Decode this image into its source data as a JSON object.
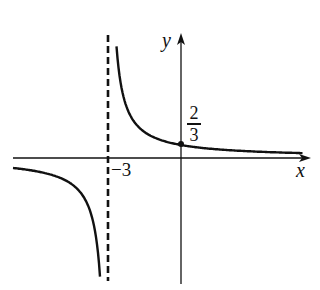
{
  "chart_data": {
    "type": "line",
    "title": "",
    "function": "y = 2/(x+3)",
    "xlabel": "x",
    "ylabel": "y",
    "annotations": {
      "vertical_asymptote": {
        "x": -3,
        "label": "−3",
        "style": "dashed"
      },
      "horizontal_asymptote": {
        "y": 0
      },
      "point": {
        "x": 0,
        "y": 0.6667,
        "label_num": "2",
        "label_den": "3"
      }
    },
    "series": [
      {
        "name": "left-branch",
        "x": [
          -10.5,
          -8,
          -6,
          -5,
          -4,
          -3.5,
          -3.2
        ],
        "y": [
          -0.267,
          -0.4,
          -0.667,
          -1,
          -2,
          -4,
          -10
        ]
      },
      {
        "name": "right-branch",
        "x": [
          -2.72,
          -2.5,
          -2,
          -1,
          0,
          1,
          2,
          3,
          4.9
        ],
        "y": [
          7.1,
          4,
          2,
          1,
          0.667,
          0.5,
          0.4,
          0.333,
          0.253
        ]
      }
    ],
    "grid": false,
    "legend": null,
    "colors": {
      "stroke": "#111111",
      "background": "#ffffff"
    }
  },
  "labels": {
    "x_axis": "x",
    "y_axis": "y",
    "asymptote_tick": "−3",
    "point_num": "2",
    "point_den": "3"
  }
}
